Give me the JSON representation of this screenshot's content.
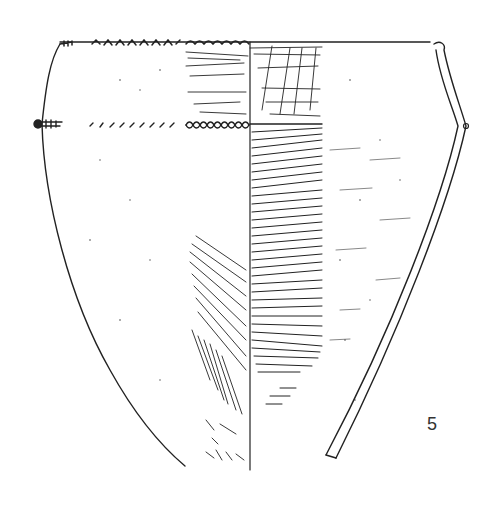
{
  "figure": {
    "number": "5",
    "view": "half exterior / half interior with profile section",
    "colors": {
      "ink": "#222222",
      "background": "#ffffff"
    }
  }
}
